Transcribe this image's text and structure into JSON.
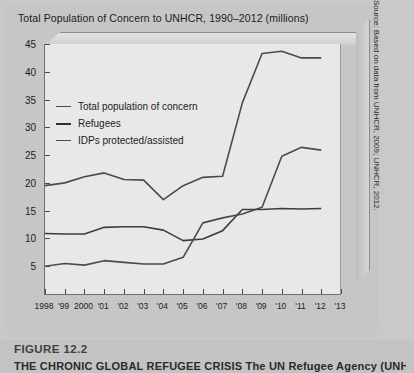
{
  "figure": {
    "number": "FIGURE 12.2",
    "caption": "THE CHRONIC GLOBAL REFUGEE CRISIS The UN Refugee Agency (UNHCR)",
    "source": "Source: Based on data from UNHCR, 2009; UNHCR, 2012."
  },
  "colors": {
    "series_line": "#4b4b4b",
    "plot_background": "#e8e8e8",
    "card_background": "#c6c6c6",
    "axis": "#6f6f6f"
  },
  "chart_data": {
    "type": "line",
    "title": "Total Population of Concern to UNHCR, 1990–2012 (millions)",
    "xlabel": "",
    "ylabel": "",
    "ylim": [
      0,
      45
    ],
    "yticks": [
      5,
      10,
      15,
      20,
      25,
      30,
      35,
      40,
      45
    ],
    "grid": false,
    "legend_position": "upper-left-inside",
    "x": [
      "1998",
      "'99",
      "2000",
      "'01",
      "'02",
      "'03",
      "'04",
      "'05",
      "'06",
      "'07",
      "'08",
      "'09",
      "'10",
      "'11",
      "'12",
      "'13"
    ],
    "xtick_labels": [
      "1998",
      "'99",
      "2000",
      "'01",
      "'02",
      "'03",
      "'04",
      "'05",
      "'06",
      "'07",
      "'08",
      "'09",
      "'10",
      "'11",
      "'12",
      "'13"
    ],
    "series": [
      {
        "name": "Total population of concern",
        "values": [
          19.5,
          20.0,
          21.1,
          21.8,
          20.6,
          20.5,
          17.0,
          19.5,
          21.0,
          21.2,
          34.4,
          43.3,
          43.7,
          42.5,
          42.5,
          null
        ]
      },
      {
        "name": "Refugees",
        "values": [
          10.9,
          10.8,
          10.8,
          12.0,
          12.1,
          12.1,
          11.5,
          9.6,
          9.9,
          11.4,
          15.2,
          15.2,
          15.4,
          15.3,
          15.4,
          null
        ]
      },
      {
        "name": "IDPs protected/assisted",
        "values": [
          5.0,
          5.5,
          5.2,
          6.0,
          5.7,
          5.4,
          5.4,
          6.6,
          12.8,
          13.7,
          14.4,
          15.6,
          24.8,
          26.4,
          25.9,
          null
        ]
      }
    ]
  }
}
